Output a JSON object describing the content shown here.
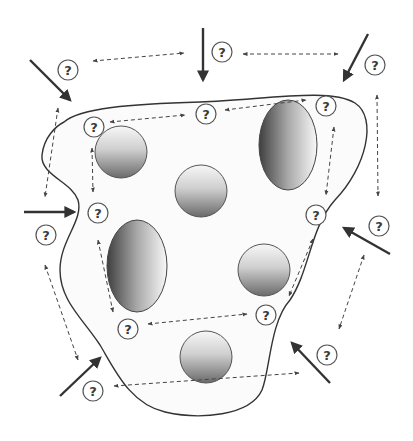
{
  "diagram": {
    "title": "",
    "background": "#ffffff",
    "membrane": {
      "stroke": "#333333",
      "fill": "#fbfbfb",
      "path": "M 64 122 C 80 108, 130 104, 200 102 C 270 99, 330 88, 355 103 C 378 118, 366 168, 335 200 C 310 228, 310 270, 290 300 C 270 322, 270 370, 262 390 C 250 416, 200 420, 165 412 C 130 404, 115 370, 100 345 C 82 318, 60 300, 60 270 C 60 240, 84 220, 78 200 C 72 182, 40 175, 42 155 C 44 137, 56 126, 64 122 Z"
    },
    "question_label": "?",
    "question_marks": [
      {
        "id": "q1",
        "x": 68,
        "y": 70
      },
      {
        "id": "q2",
        "x": 222,
        "y": 52
      },
      {
        "id": "q3",
        "x": 375,
        "y": 65
      },
      {
        "id": "q4",
        "x": 94,
        "y": 127
      },
      {
        "id": "q5",
        "x": 206,
        "y": 114
      },
      {
        "id": "q6",
        "x": 326,
        "y": 106
      },
      {
        "id": "q7",
        "x": 98,
        "y": 213
      },
      {
        "id": "q8",
        "x": 46,
        "y": 235
      },
      {
        "id": "q9",
        "x": 316,
        "y": 215
      },
      {
        "id": "q10",
        "x": 379,
        "y": 226
      },
      {
        "id": "q11",
        "x": 128,
        "y": 329
      },
      {
        "id": "q12",
        "x": 266,
        "y": 315
      },
      {
        "id": "q13",
        "x": 327,
        "y": 355
      },
      {
        "id": "q14",
        "x": 93,
        "y": 391
      }
    ],
    "spheres": [
      {
        "id": "s1",
        "cx": 121,
        "cy": 152,
        "r": 26
      },
      {
        "id": "s2",
        "cx": 201,
        "cy": 191,
        "r": 26
      },
      {
        "id": "s3",
        "cx": 264,
        "cy": 270,
        "r": 26
      },
      {
        "id": "s4",
        "cx": 206,
        "cy": 357,
        "r": 26
      }
    ],
    "ellipses": [
      {
        "id": "e1",
        "cx": 288,
        "cy": 145,
        "rx": 29,
        "ry": 45
      },
      {
        "id": "e2",
        "cx": 137,
        "cy": 266,
        "rx": 30,
        "ry": 46
      }
    ],
    "solid_arrows": [
      {
        "id": "a1",
        "x1": 30,
        "y1": 60,
        "x2": 70,
        "y2": 100
      },
      {
        "id": "a2",
        "x1": 203,
        "y1": 28,
        "x2": 203,
        "y2": 80
      },
      {
        "id": "a3",
        "x1": 368,
        "y1": 34,
        "x2": 344,
        "y2": 80
      },
      {
        "id": "a4",
        "x1": 24,
        "y1": 212,
        "x2": 74,
        "y2": 212
      },
      {
        "id": "a5",
        "x1": 390,
        "y1": 254,
        "x2": 344,
        "y2": 228
      },
      {
        "id": "a6",
        "x1": 60,
        "y1": 396,
        "x2": 100,
        "y2": 358
      },
      {
        "id": "a7",
        "x1": 330,
        "y1": 383,
        "x2": 292,
        "y2": 343
      }
    ],
    "dashed_arrows": [
      {
        "id": "d1",
        "x1": 93,
        "y1": 61,
        "x2": 184,
        "y2": 53
      },
      {
        "id": "d2",
        "x1": 243,
        "y1": 54,
        "x2": 338,
        "y2": 54
      },
      {
        "id": "d3",
        "x1": 58,
        "y1": 108,
        "x2": 45,
        "y2": 197
      },
      {
        "id": "d4",
        "x1": 110,
        "y1": 122,
        "x2": 185,
        "y2": 115
      },
      {
        "id": "d5",
        "x1": 225,
        "y1": 110,
        "x2": 306,
        "y2": 100
      },
      {
        "id": "d6",
        "x1": 92,
        "y1": 148,
        "x2": 93,
        "y2": 192
      },
      {
        "id": "d7",
        "x1": 377,
        "y1": 95,
        "x2": 378,
        "y2": 196
      },
      {
        "id": "d8",
        "x1": 334,
        "y1": 127,
        "x2": 326,
        "y2": 195
      },
      {
        "id": "d9",
        "x1": 98,
        "y1": 240,
        "x2": 113,
        "y2": 312
      },
      {
        "id": "d10",
        "x1": 45,
        "y1": 265,
        "x2": 78,
        "y2": 360
      },
      {
        "id": "d11",
        "x1": 313,
        "y1": 239,
        "x2": 289,
        "y2": 296
      },
      {
        "id": "d12",
        "x1": 364,
        "y1": 255,
        "x2": 339,
        "y2": 329
      },
      {
        "id": "d13",
        "x1": 148,
        "y1": 324,
        "x2": 247,
        "y2": 314
      },
      {
        "id": "d14",
        "x1": 114,
        "y1": 386,
        "x2": 299,
        "y2": 373
      }
    ],
    "colors": {
      "line": "#333333",
      "dash": "#444444",
      "question_stroke": "#555555",
      "sphere_light": "#f4f4f4",
      "sphere_dark": "#6a6a6a",
      "ellipse_dark": "#4a4a4a",
      "ellipse_light": "#f6f6f6"
    }
  }
}
